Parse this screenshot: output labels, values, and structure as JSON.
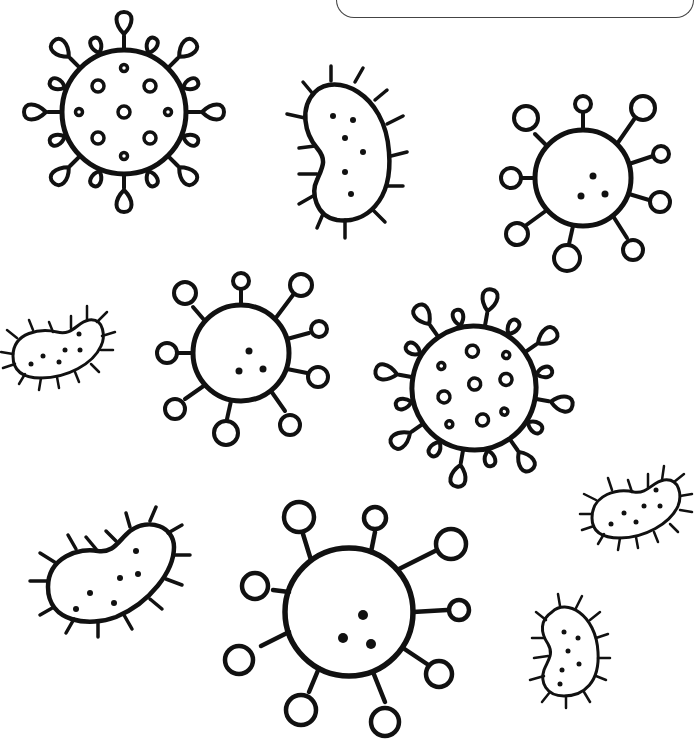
{
  "page": {
    "type": "coloring-page",
    "theme": "viruses and bacteria",
    "background": "#ffffff",
    "line_color": "#111111"
  },
  "title_box": {
    "text": ""
  },
  "viruses": [
    {
      "id": "virus-crown-1",
      "style": "teardrop-spikes",
      "cx": 124,
      "cy": 112,
      "r": 62,
      "spikes": 16
    },
    {
      "id": "virus-ball-1",
      "style": "ball-spikes",
      "cx": 583,
      "cy": 178,
      "r": 48,
      "spikes": 9
    },
    {
      "id": "virus-ball-2",
      "style": "ball-spikes",
      "cx": 241,
      "cy": 353,
      "r": 48,
      "spikes": 9
    },
    {
      "id": "virus-crown-2",
      "style": "teardrop-spikes",
      "cx": 474,
      "cy": 388,
      "r": 62,
      "spikes": 16
    },
    {
      "id": "virus-ball-3",
      "style": "ball-spikes",
      "cx": 349,
      "cy": 612,
      "r": 64,
      "spikes": 9
    }
  ],
  "bacteria": [
    {
      "id": "bacterium-1",
      "cx": 345,
      "cy": 152
    },
    {
      "id": "bacterium-2",
      "cx": 57,
      "cy": 350
    },
    {
      "id": "bacterium-3",
      "cx": 110,
      "cy": 575
    },
    {
      "id": "bacterium-4",
      "cx": 636,
      "cy": 508
    },
    {
      "id": "bacterium-5",
      "cx": 568,
      "cy": 652
    }
  ]
}
